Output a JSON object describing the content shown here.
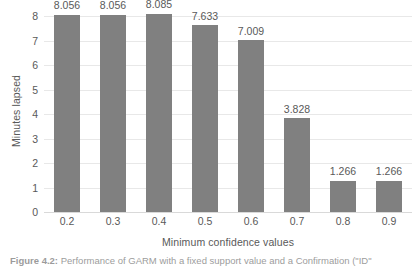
{
  "chart_data": {
    "type": "bar",
    "title": "",
    "subtitle": "",
    "xlabel": "Minimum confidence values",
    "ylabel": "Minutes lapsed",
    "categories": [
      "0.2",
      "0.3",
      "0.4",
      "0.5",
      "0.6",
      "0.7",
      "0.8",
      "0.9"
    ],
    "values": [
      8.056,
      8.056,
      8.085,
      7.633,
      7.009,
      3.828,
      1.266,
      1.266
    ],
    "data_labels": [
      "8.056",
      "8.056",
      "8.085",
      "7.633",
      "7.009",
      "3.828",
      "1.266",
      "1.266"
    ],
    "ylim": [
      0,
      8
    ],
    "yticks": [
      0,
      1,
      2,
      3,
      4,
      5,
      6,
      7,
      8
    ],
    "ytick_labels": [
      "0",
      "1",
      "2",
      "3",
      "4",
      "5",
      "6",
      "7",
      "8"
    ],
    "grid": true,
    "grid_axis": "y",
    "legend": false,
    "legend_position": "none",
    "bar_color": "#808080",
    "gridline_color": "#e8e8e8",
    "text_color": "#595959",
    "background_color": "#ffffff"
  },
  "caption": {
    "figure_label": "Figure 4.2:",
    "text": "Performance of GARM with a fixed support value and a Confirmation (\"ID\""
  }
}
